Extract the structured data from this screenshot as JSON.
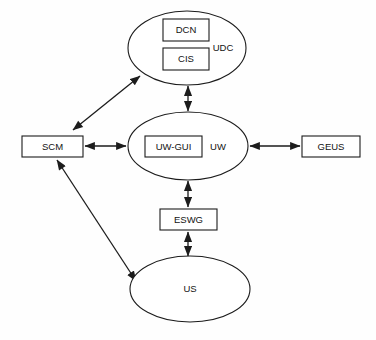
{
  "diagram": {
    "type": "block-diagram",
    "background_color": "#fefefe",
    "line_color": "#1a1a1a",
    "fill_color": "#ffffff",
    "nodes": [
      {
        "id": "udc",
        "label": "UDC",
        "shape": "ellipse",
        "cx": 187,
        "cy": 48,
        "rx": 59,
        "ry": 37,
        "label_x": 223,
        "label_y": 48
      },
      {
        "id": "dcn",
        "label": "DCN",
        "shape": "rect",
        "x": 163,
        "y": 19,
        "width": 46,
        "height": 22
      },
      {
        "id": "cis",
        "label": "CIS",
        "shape": "rect",
        "x": 163,
        "y": 48,
        "width": 46,
        "height": 22
      },
      {
        "id": "uw",
        "label": "UW",
        "shape": "ellipse",
        "cx": 188,
        "cy": 146,
        "rx": 60,
        "ry": 34,
        "label_x": 218,
        "label_y": 147
      },
      {
        "id": "uw-gui",
        "label": "UW-GUI",
        "shape": "rect",
        "x": 145,
        "y": 136,
        "width": 57,
        "height": 21
      },
      {
        "id": "scm",
        "label": "SCM",
        "shape": "rect",
        "x": 22,
        "y": 136,
        "width": 61,
        "height": 21
      },
      {
        "id": "geus",
        "label": "GEUS",
        "shape": "rect",
        "x": 302,
        "y": 136,
        "width": 58,
        "height": 21
      },
      {
        "id": "eswg",
        "label": "ESWG",
        "shape": "rect",
        "x": 160,
        "y": 209,
        "width": 57,
        "height": 21
      },
      {
        "id": "us",
        "label": "US",
        "shape": "ellipse",
        "cx": 190,
        "cy": 289,
        "rx": 60,
        "ry": 33,
        "label_x": 190,
        "label_y": 289
      }
    ],
    "edges": [
      {
        "id": "scm-udc",
        "from": "scm",
        "to": "udc",
        "arrowheads": "both",
        "path": "M 73 130 L 140 76"
      },
      {
        "id": "udc-uw",
        "from": "udc",
        "to": "uw",
        "arrowheads": "both",
        "path": "M 188 86 L 188 111"
      },
      {
        "id": "scm-uw",
        "from": "scm",
        "to": "uw",
        "arrowheads": "both",
        "path": "M 85 146 L 126 146"
      },
      {
        "id": "uw-geus",
        "from": "uw",
        "to": "geus",
        "arrowheads": "both",
        "path": "M 250 146 L 300 146"
      },
      {
        "id": "uw-eswg",
        "from": "uw",
        "to": "eswg",
        "arrowheads": "both",
        "path": "M 188 181 L 188 207"
      },
      {
        "id": "eswg-us",
        "from": "eswg",
        "to": "us",
        "arrowheads": "both",
        "path": "M 188 232 L 188 256"
      },
      {
        "id": "scm-us",
        "from": "scm",
        "to": "us",
        "arrowheads": "both",
        "path": "M 57 160 L 136 281"
      }
    ]
  }
}
